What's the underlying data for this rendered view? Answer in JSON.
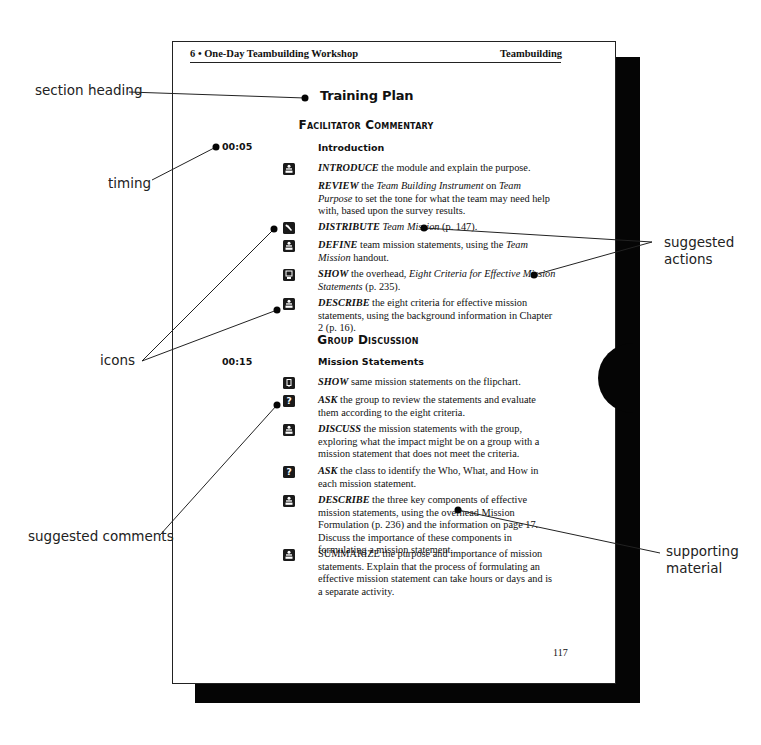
{
  "page": {
    "header": {
      "left": "6 • One-Day Teambuilding Workshop",
      "right": "Teambuilding"
    },
    "section_title": "Training Plan",
    "page_number": "117",
    "sections": [
      {
        "title": "Facilitator Commentary",
        "timing": "00:05",
        "subheading": "Introduction",
        "items": [
          {
            "icon": "presenter-icon",
            "verb": "INTRODUCE",
            "text": " the module and explain the purpose."
          },
          {
            "icon": null,
            "verb": "REVIEW",
            "text_parts": [
              " the ",
              "Team Building Instrument",
              " on ",
              "Team Purpose",
              " to set the tone for what the team may need help with, based upon the survey results."
            ]
          },
          {
            "icon": "handout-icon",
            "verb": "DISTRIBUTE",
            "text_parts": [
              " ",
              "Team Mission",
              " (p. 147)."
            ]
          },
          {
            "icon": "presenter-icon",
            "verb": "DEFINE",
            "text_parts": [
              " team mission statements, using the ",
              "Team Mission",
              " handout."
            ]
          },
          {
            "icon": "overhead-icon",
            "verb": "SHOW",
            "text_parts": [
              " the overhead, ",
              "Eight Criteria for Effective Mission State­ments",
              " (p. 235)."
            ]
          },
          {
            "icon": "presenter-icon",
            "verb": "DESCRIBE",
            "text": " the eight criteria for effective mission statements, using the background information in Chapter 2 (p. 16)."
          }
        ]
      },
      {
        "title": "Group Discussion",
        "timing": "00:15",
        "subheading": "Mission Statements",
        "items": [
          {
            "icon": "flipchart-icon",
            "verb": "SHOW",
            "text": " same mission statements on the flipchart."
          },
          {
            "icon": "question-icon",
            "verb": "ASK",
            "text": " the group to review the statements and evaluate them accord­ing to the eight criteria."
          },
          {
            "icon": "presenter-icon",
            "verb": "DISCUSS",
            "text": " the mission statements with the group, exploring what the impact might be on a group with a mission statement that does not meet the criteria."
          },
          {
            "icon": "question-icon",
            "verb": "ASK",
            "text": " the class to identify the Who, What, and How in each mission statement."
          },
          {
            "icon": "presenter-icon",
            "verb": "DESCRIBE",
            "text": " the three key components of effective mission state­ments, using the overhead Mission Formulation (p. 236) and the information on page 17. Discuss the importance of these compo­nents in formulating a mission statement."
          },
          {
            "icon": "presenter-icon",
            "verb": "SUMMARIZE",
            "text": " the purpose and importance of mission statements. Explain that the process of formulating an effective mission state­ment can take hours or days and is a separate activity."
          }
        ]
      }
    ]
  },
  "callouts": {
    "section_heading": "section heading",
    "timing": "timing",
    "icons": "icons",
    "suggested_comments": "suggested comments",
    "suggested_actions_1": "suggested",
    "suggested_actions_2": "actions",
    "supporting_material_1": "supporting",
    "supporting_material_2": "material"
  },
  "colors": {
    "ink": "#111111",
    "shadow": "#050505",
    "page": "#ffffff"
  }
}
